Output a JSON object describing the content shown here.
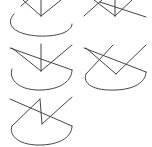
{
  "figure": {
    "layout": "2-column grid of line-drawing panels",
    "stroke_color": "#444444",
    "background": "#ffffff",
    "panels": [
      {
        "id": 1,
        "position": "row1-col1",
        "description": "sector arc with vertical line and V shape"
      },
      {
        "id": 2,
        "position": "row1-col2",
        "description": "crossing lines with vertical line"
      },
      {
        "id": 3,
        "position": "row2-col1",
        "description": "sector arc with diagonal, vertical line and V shape"
      },
      {
        "id": 4,
        "position": "row2-col2",
        "description": "sector arc with diagonal and V shape"
      },
      {
        "id": 5,
        "position": "row3-col1",
        "description": "sector arc with diagonal and zigzag"
      }
    ]
  }
}
